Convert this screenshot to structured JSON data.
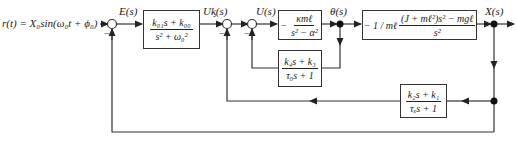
{
  "diagram": {
    "input": {
      "label": "r(t) = X₀sin(ω₀t + ϕ₀)"
    },
    "signals": {
      "error": "E(s)",
      "uc": "Uᶄ(s)",
      "u": "U(s)",
      "theta": "θ(s)",
      "output": "X(s)"
    },
    "blocks": {
      "controller": {
        "num": "k₀₁s + k₀₀",
        "den": "s² + ω₀²"
      },
      "plant_angle": {
        "prefix": "−",
        "num": "κmℓ",
        "den": "s² − α²"
      },
      "plant_position": {
        "prefix": "− 1 / mℓ",
        "num": "(J + mℓ²)s² − mgℓ",
        "den": "s²"
      },
      "angle_feedback": {
        "num": "k₄s + k₃",
        "den": "τ₀s + 1"
      },
      "position_feedback": {
        "num": "k₂s + k₁",
        "den": "τₓs + 1"
      }
    },
    "summing_signs": [
      "−",
      "−",
      "−"
    ],
    "colors": {
      "line": "#333333",
      "background": "#ffffff"
    }
  }
}
